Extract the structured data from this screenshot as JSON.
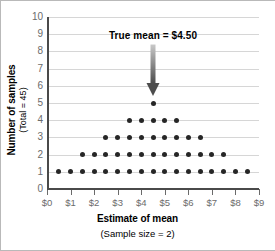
{
  "chart_data": {
    "type": "scatter",
    "title": "",
    "xlabel": "Estimate of mean",
    "xlabel_sub": "(Sample size = 2)",
    "ylabel": "Number of samples",
    "ylabel_sub": "(Total = 45)",
    "xlim": [
      0,
      9
    ],
    "ylim": [
      0,
      10
    ],
    "grid": true,
    "legend": "none",
    "xticks": [
      0,
      1,
      2,
      3,
      4,
      5,
      6,
      7,
      8,
      9
    ],
    "xtick_labels": [
      "$0",
      "$1",
      "$2",
      "$3",
      "$4",
      "$5",
      "$6",
      "$7",
      "$8",
      "$9"
    ],
    "yticks": [
      0,
      1,
      2,
      3,
      4,
      5,
      6,
      7,
      8,
      9,
      10
    ],
    "ytick_labels": [
      "0",
      "1",
      "2",
      "3",
      "4",
      "5",
      "6",
      "7",
      "8",
      "9",
      "10"
    ],
    "dot_rows": [
      {
        "count": 1,
        "x_start": 0.5,
        "x_end": 8.5,
        "x_step": 0.5,
        "n_dots": 17
      },
      {
        "count": 2,
        "x_start": 1.5,
        "x_end": 7.5,
        "x_step": 0.5,
        "n_dots": 13
      },
      {
        "count": 3,
        "x_start": 2.5,
        "x_end": 6.5,
        "x_step": 0.5,
        "n_dots": 9
      },
      {
        "count": 4,
        "x_start": 3.5,
        "x_end": 5.5,
        "x_step": 0.5,
        "n_dots": 5
      },
      {
        "count": 5,
        "x_start": 4.5,
        "x_end": 4.5,
        "x_step": 0.5,
        "n_dots": 1
      }
    ],
    "annotations": [
      {
        "text": "True mean  =  $4.50",
        "arrow_x": 4.5,
        "arrow_y_top": 8.4,
        "arrow_y_tip": 5.4
      }
    ],
    "colors": {
      "dot": "#262626",
      "gridline": "#d6d6d6",
      "axis": "#4a4a4a",
      "tick_label": "#6b6b6b",
      "arrow": "#7a7a7a",
      "background": "#ffffff"
    }
  }
}
